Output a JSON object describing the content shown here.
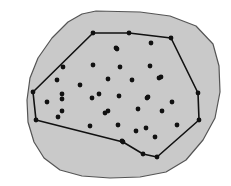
{
  "figure": {
    "type": "convex-hull-point-set-diagram",
    "canvas": {
      "width": 231,
      "height": 186,
      "background": "#ffffff"
    },
    "region": {
      "name": "shaded-region",
      "fill": "#c9c9c9",
      "stroke": "#555555",
      "stroke_width": 1.2,
      "outline_points": [
        [
          96,
          11
        ],
        [
          140,
          12
        ],
        [
          170,
          16
        ],
        [
          196,
          26
        ],
        [
          213,
          44
        ],
        [
          219,
          66
        ],
        [
          220,
          92
        ],
        [
          215,
          118
        ],
        [
          203,
          140
        ],
        [
          186,
          160
        ],
        [
          166,
          172
        ],
        [
          140,
          177
        ],
        [
          110,
          178
        ],
        [
          82,
          176
        ],
        [
          60,
          170
        ],
        [
          44,
          158
        ],
        [
          34,
          142
        ],
        [
          28,
          122
        ],
        [
          27,
          100
        ],
        [
          30,
          78
        ],
        [
          38,
          58
        ],
        [
          52,
          38
        ],
        [
          68,
          22
        ],
        [
          82,
          14
        ]
      ]
    },
    "hull": {
      "name": "convex-hull-polygon",
      "stroke": "#111111",
      "stroke_width": 1.6,
      "fill": "none",
      "vertices": [
        [
          93,
          33
        ],
        [
          129,
          33
        ],
        [
          171,
          38
        ],
        [
          198,
          93
        ],
        [
          199,
          120
        ],
        [
          157,
          157
        ],
        [
          143,
          154
        ],
        [
          123,
          142
        ],
        [
          36,
          120
        ],
        [
          33,
          92
        ]
      ]
    },
    "points": {
      "name": "point-set",
      "color": "#111111",
      "radius": 2.4,
      "count": 41,
      "hull_points": [
        [
          93,
          33
        ],
        [
          129,
          33
        ],
        [
          171,
          38
        ],
        [
          198,
          93
        ],
        [
          199,
          120
        ],
        [
          157,
          157
        ],
        [
          143,
          154
        ],
        [
          123,
          142
        ],
        [
          36,
          120
        ],
        [
          33,
          92
        ]
      ],
      "interior_points": [
        [
          116,
          48
        ],
        [
          151,
          43
        ],
        [
          63,
          67
        ],
        [
          93,
          65
        ],
        [
          117,
          49
        ],
        [
          57,
          80
        ],
        [
          80,
          85
        ],
        [
          120,
          67
        ],
        [
          150,
          66
        ],
        [
          161,
          77
        ],
        [
          62,
          94
        ],
        [
          99,
          94
        ],
        [
          108,
          79
        ],
        [
          132,
          80
        ],
        [
          159,
          78
        ],
        [
          47,
          102
        ],
        [
          62,
          99
        ],
        [
          92,
          98
        ],
        [
          105,
          113
        ],
        [
          119,
          96
        ],
        [
          148,
          97
        ],
        [
          147,
          98
        ],
        [
          162,
          111
        ],
        [
          172,
          102
        ],
        [
          58,
          117
        ],
        [
          62,
          111
        ],
        [
          90,
          126
        ],
        [
          108,
          111
        ],
        [
          118,
          125
        ],
        [
          138,
          109
        ],
        [
          146,
          128
        ],
        [
          177,
          125
        ],
        [
          122,
          141
        ],
        [
          136,
          131
        ],
        [
          155,
          137
        ]
      ]
    }
  }
}
